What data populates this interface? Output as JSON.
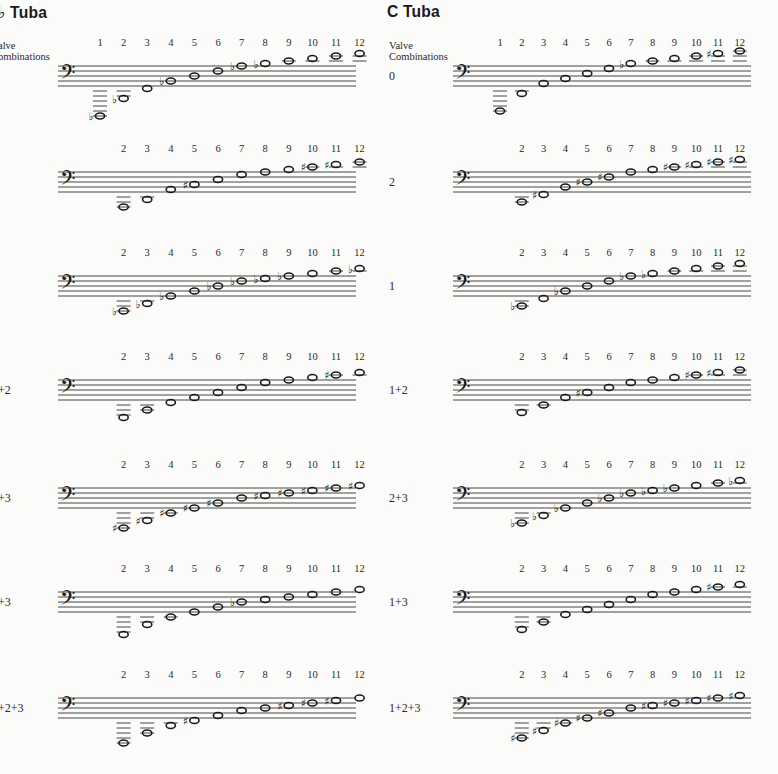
{
  "panels": [
    {
      "id": "bb",
      "title": "♭ Tuba",
      "title_x": -2,
      "staff_x0": 58,
      "staff_x1": 356,
      "note_x0": 100,
      "note_dx": 23.6,
      "label_x": -2,
      "valve_label": [
        "alve",
        "ombinations"
      ],
      "valve_label_x": -2,
      "rows": [
        {
          "label": "",
          "top": 66,
          "start": 1,
          "notes": [
            [
              -12,
              "b"
            ],
            [
              -5,
              "b"
            ],
            [
              -1,
              ""
            ],
            [
              2,
              "b"
            ],
            [
              4,
              ""
            ],
            [
              6,
              ""
            ],
            [
              8,
              "b"
            ],
            [
              9,
              "b"
            ],
            [
              10,
              ""
            ],
            [
              11,
              ""
            ],
            [
              12,
              ""
            ],
            [
              13,
              ""
            ]
          ]
        },
        {
          "label": "",
          "top": 172,
          "start": 2,
          "notes": [
            [
              -6,
              ""
            ],
            [
              -3,
              ""
            ],
            [
              1,
              ""
            ],
            [
              3,
              "#"
            ],
            [
              5,
              ""
            ],
            [
              7,
              ""
            ],
            [
              8,
              ""
            ],
            [
              9,
              ""
            ],
            [
              10,
              "#"
            ],
            [
              11,
              "#"
            ],
            [
              12,
              ""
            ]
          ]
        },
        {
          "label": "",
          "top": 276,
          "start": 2,
          "notes": [
            [
              -6,
              "b"
            ],
            [
              -3,
              "b"
            ],
            [
              0,
              "b"
            ],
            [
              2,
              ""
            ],
            [
              4,
              "b"
            ],
            [
              6,
              "b"
            ],
            [
              7,
              "b"
            ],
            [
              8,
              "b"
            ],
            [
              9,
              ""
            ],
            [
              10,
              ""
            ],
            [
              11,
              "b"
            ]
          ]
        },
        {
          "label": "+2",
          "top": 380,
          "start": 2,
          "notes": [
            [
              -7,
              ""
            ],
            [
              -4,
              ""
            ],
            [
              -1,
              ""
            ],
            [
              1,
              ""
            ],
            [
              3,
              ""
            ],
            [
              5,
              ""
            ],
            [
              7,
              ""
            ],
            [
              8,
              ""
            ],
            [
              9,
              ""
            ],
            [
              10,
              "#"
            ],
            [
              11,
              ""
            ]
          ]
        },
        {
          "label": "+3",
          "top": 488,
          "start": 2,
          "notes": [
            [
              -8,
              "#"
            ],
            [
              -5,
              "#"
            ],
            [
              -2,
              "#"
            ],
            [
              0,
              "#"
            ],
            [
              2,
              "#"
            ],
            [
              4,
              ""
            ],
            [
              5,
              "#"
            ],
            [
              6,
              "#"
            ],
            [
              7,
              "#"
            ],
            [
              8,
              "#"
            ],
            [
              9,
              "#"
            ]
          ]
        },
        {
          "label": "+3",
          "top": 592,
          "start": 2,
          "notes": [
            [
              -9,
              ""
            ],
            [
              -5,
              ""
            ],
            [
              -2,
              ""
            ],
            [
              0,
              ""
            ],
            [
              2,
              ""
            ],
            [
              4,
              "b"
            ],
            [
              5,
              ""
            ],
            [
              6,
              ""
            ],
            [
              7,
              ""
            ],
            [
              8,
              ""
            ],
            [
              9,
              ""
            ]
          ]
        },
        {
          "label": "+2+3",
          "top": 698,
          "start": 2,
          "notes": [
            [
              -10,
              ""
            ],
            [
              -6,
              ""
            ],
            [
              -3,
              ""
            ],
            [
              -1,
              "#"
            ],
            [
              1,
              ""
            ],
            [
              3,
              ""
            ],
            [
              4,
              ""
            ],
            [
              5,
              "#"
            ],
            [
              6,
              "#"
            ],
            [
              7,
              "#"
            ],
            [
              8,
              ""
            ]
          ]
        }
      ]
    },
    {
      "id": "c",
      "title": "C  Tuba",
      "title_x": 387,
      "staff_x0": 453,
      "staff_x1": 751,
      "note_x0": 500,
      "note_dx": 21.8,
      "label_x": 389,
      "valve_label": [
        "Valve",
        "Combinations"
      ],
      "valve_label_x": 389,
      "rows": [
        {
          "label": "0",
          "top": 66,
          "start": 1,
          "notes": [
            [
              -10,
              ""
            ],
            [
              -3,
              ""
            ],
            [
              1,
              ""
            ],
            [
              3,
              ""
            ],
            [
              5,
              ""
            ],
            [
              7,
              ""
            ],
            [
              9,
              "b"
            ],
            [
              10,
              ""
            ],
            [
              11,
              ""
            ],
            [
              12,
              ""
            ],
            [
              13,
              "#"
            ],
            [
              14,
              ""
            ]
          ]
        },
        {
          "label": "2",
          "top": 172,
          "start": 2,
          "notes": [
            [
              -4,
              ""
            ],
            [
              -1,
              "#"
            ],
            [
              2,
              ""
            ],
            [
              4,
              "#"
            ],
            [
              6,
              "#"
            ],
            [
              8,
              ""
            ],
            [
              9,
              ""
            ],
            [
              10,
              "#"
            ],
            [
              11,
              "#"
            ],
            [
              12,
              "#"
            ],
            [
              13,
              "#"
            ]
          ]
        },
        {
          "label": "1",
          "top": 276,
          "start": 2,
          "notes": [
            [
              -4,
              "b"
            ],
            [
              -1,
              ""
            ],
            [
              2,
              "b"
            ],
            [
              4,
              ""
            ],
            [
              6,
              ""
            ],
            [
              8,
              "b"
            ],
            [
              9,
              "b"
            ],
            [
              10,
              ""
            ],
            [
              11,
              ""
            ],
            [
              12,
              ""
            ],
            [
              13,
              ""
            ]
          ]
        },
        {
          "label": "1+2",
          "top": 380,
          "start": 2,
          "notes": [
            [
              -5,
              ""
            ],
            [
              -2,
              ""
            ],
            [
              1,
              ""
            ],
            [
              3,
              "#"
            ],
            [
              5,
              ""
            ],
            [
              7,
              ""
            ],
            [
              8,
              ""
            ],
            [
              9,
              ""
            ],
            [
              10,
              "#"
            ],
            [
              11,
              "#"
            ],
            [
              12,
              ""
            ]
          ]
        },
        {
          "label": "2+3",
          "top": 488,
          "start": 2,
          "notes": [
            [
              -6,
              "b"
            ],
            [
              -3,
              "b"
            ],
            [
              0,
              "b"
            ],
            [
              2,
              ""
            ],
            [
              4,
              "b"
            ],
            [
              6,
              "b"
            ],
            [
              7,
              "b"
            ],
            [
              8,
              "b"
            ],
            [
              9,
              ""
            ],
            [
              10,
              ""
            ],
            [
              11,
              "b"
            ]
          ]
        },
        {
          "label": "1+3",
          "top": 592,
          "start": 2,
          "notes": [
            [
              -7,
              ""
            ],
            [
              -4,
              ""
            ],
            [
              -1,
              ""
            ],
            [
              1,
              ""
            ],
            [
              3,
              ""
            ],
            [
              5,
              ""
            ],
            [
              7,
              ""
            ],
            [
              8,
              ""
            ],
            [
              9,
              ""
            ],
            [
              10,
              "#"
            ],
            [
              11,
              ""
            ]
          ]
        },
        {
          "label": "1+2+3",
          "top": 698,
          "start": 2,
          "notes": [
            [
              -8,
              "#"
            ],
            [
              -5,
              "#"
            ],
            [
              -2,
              "#"
            ],
            [
              0,
              "#"
            ],
            [
              2,
              "#"
            ],
            [
              4,
              ""
            ],
            [
              5,
              "#"
            ],
            [
              6,
              "#"
            ],
            [
              7,
              "#"
            ],
            [
              8,
              "#"
            ],
            [
              9,
              "#"
            ]
          ]
        }
      ]
    }
  ],
  "staff": {
    "line_gap": 5,
    "lines": 5
  },
  "ink_color": "#1a1a1a",
  "paper_color": "#fbfbf9"
}
